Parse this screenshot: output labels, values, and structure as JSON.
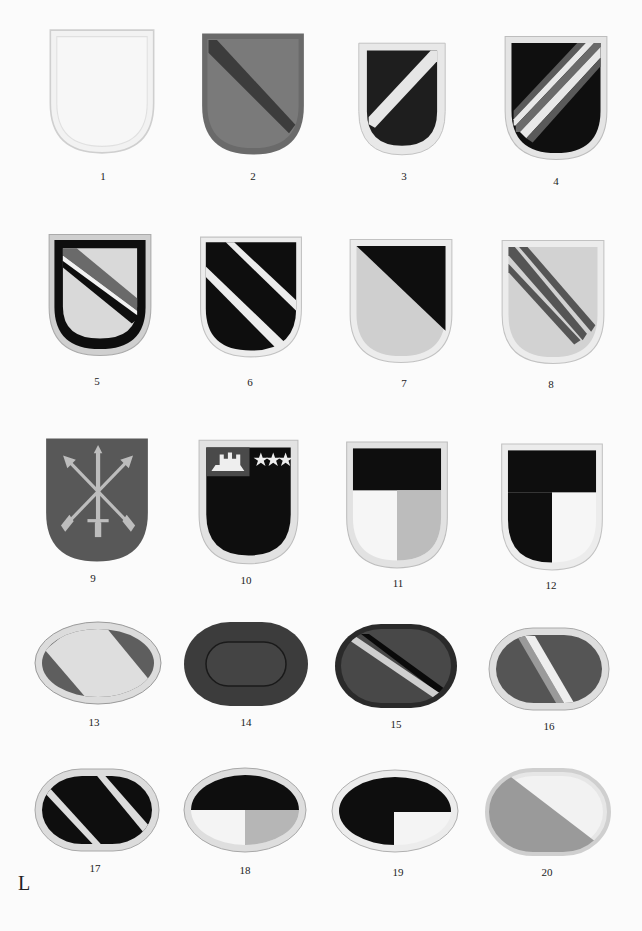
{
  "plate": {
    "letter": "L",
    "background": "#fbfbfb"
  },
  "colors": {
    "white": "#f4f4f4",
    "light_gray": "#d6d6d6",
    "mid_gray": "#8a8a8a",
    "dark_gray": "#555555",
    "very_dark": "#2e2e2e",
    "black": "#0e0e0e",
    "border_light": "#e6e6e6"
  },
  "items": [
    {
      "number": "1",
      "shape": "flash",
      "description": "plain white flash"
    },
    {
      "number": "2",
      "shape": "flash",
      "description": "dark gray flash with darker diagonal bend"
    },
    {
      "number": "3",
      "shape": "flash",
      "description": "black flash, white border, white bend sinister"
    },
    {
      "number": "4",
      "shape": "flash",
      "description": "black flash with three bend sinister stripes white/gray/white"
    },
    {
      "number": "5",
      "shape": "flash",
      "description": "light flash with black border and black/white/gray diagonal bend"
    },
    {
      "number": "6",
      "shape": "flash",
      "description": "black flash with two white diagonal bends"
    },
    {
      "number": "7",
      "shape": "flash",
      "description": "light gray flash with black upper-right triangle"
    },
    {
      "number": "8",
      "shape": "flash",
      "description": "light gray flash with two gray diagonal stripes"
    },
    {
      "number": "9",
      "shape": "flash",
      "description": "gray flash with crossed arrows and dagger insignia"
    },
    {
      "number": "10",
      "shape": "flash",
      "description": "black flash with castle canton and three stars"
    },
    {
      "number": "11",
      "shape": "flash",
      "description": "black chief, white and gray lower quarters"
    },
    {
      "number": "12",
      "shape": "flash",
      "description": "black chief and black lower-left, white lower-right"
    },
    {
      "number": "13",
      "shape": "oval",
      "description": "gray oval with white diagonal band"
    },
    {
      "number": "14",
      "shape": "oval",
      "description": "dark gray oval with inner outline"
    },
    {
      "number": "15",
      "shape": "oval",
      "description": "dark oval with light and black diagonal stripes"
    },
    {
      "number": "16",
      "shape": "oval",
      "description": "dark oval with gray and white diagonal stripes"
    },
    {
      "number": "17",
      "shape": "oval",
      "description": "black oval with two white diagonal stripes"
    },
    {
      "number": "18",
      "shape": "oval",
      "description": "black upper half, white and gray lower quarters"
    },
    {
      "number": "19",
      "shape": "oval",
      "description": "black upper half and lower-left, white lower-right"
    },
    {
      "number": "20",
      "shape": "oval",
      "description": "white oval with gray lower-left triangle"
    }
  ]
}
